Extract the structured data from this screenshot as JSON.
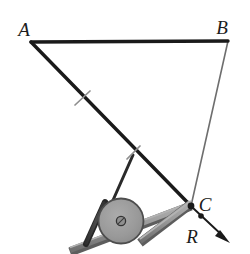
{
  "figure": {
    "background_color": "#ffffff",
    "width": 250,
    "height": 254,
    "labels": {
      "A": "A",
      "B": "B",
      "C": "C",
      "R": "R"
    },
    "label_positions": {
      "A": {
        "x": 24,
        "y": 36
      },
      "B": {
        "x": 221,
        "y": 34
      },
      "C": {
        "x": 203,
        "y": 209
      },
      "R": {
        "x": 192,
        "y": 239
      }
    },
    "vertices": {
      "A": {
        "x": 31,
        "y": 42
      },
      "B": {
        "x": 228,
        "y": 41
      },
      "C": {
        "x": 191,
        "y": 206
      }
    },
    "colors": {
      "line_heavy": "#1a1a1a",
      "line_light": "#6e6e6e",
      "wheel_fill": "#9a9a9a",
      "wheel_stroke": "#4d4d4d",
      "hub_fill": "#8c8c8c",
      "hub_stroke": "#3a3a3a",
      "rail_fill": "#8a8a8a",
      "rail_stroke": "#595959",
      "rail_top_fill": "#a5a5a5",
      "bracket_fill": "#3c3c3c",
      "arrow_color": "#1a1a1a",
      "tick_color": "#8e8e8e"
    },
    "members": [
      {
        "name": "AB",
        "from": "A",
        "to": "B",
        "style": "heavy"
      },
      {
        "name": "AC",
        "from": "A",
        "to": "C",
        "style": "heavy"
      },
      {
        "name": "BC",
        "from": "B",
        "to": "C",
        "style": "light"
      }
    ],
    "tick_marks": [
      {
        "name": "tick-upper-ac",
        "x": 82,
        "y": 98
      },
      {
        "name": "tick-lower-ac",
        "x": 133,
        "y": 152
      }
    ],
    "strut": {
      "from": {
        "x": 133,
        "y": 155
      },
      "to": {
        "x": 110,
        "y": 207
      }
    },
    "wheel": {
      "cx": 121,
      "cy": 221,
      "r": 22.5
    },
    "hub": {
      "cx": 121,
      "cy": 221,
      "r": 4.5
    },
    "rail": {
      "from": {
        "x": 72,
        "y": 251
      },
      "to": {
        "x": 190,
        "y": 206
      },
      "thickness": 7
    },
    "bracket": {
      "from": {
        "x": 104,
        "y": 203
      },
      "to": {
        "x": 85,
        "y": 243
      },
      "thickness": 5
    },
    "force_arrow": {
      "name": "R",
      "from": {
        "x": 191,
        "y": 206
      },
      "to": {
        "x": 228,
        "y": 241
      },
      "dot": {
        "x": 200,
        "y": 215
      }
    }
  }
}
